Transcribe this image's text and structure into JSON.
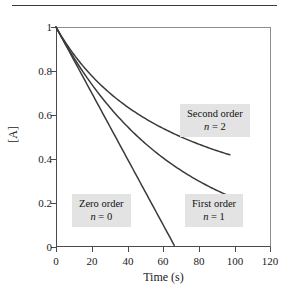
{
  "figure": {
    "top_rule": "horizontal-rule"
  },
  "axes": {
    "x_title": "Time (s)",
    "y_title": "[A]",
    "x_ticks": [
      "0",
      "20",
      "40",
      "60",
      "80",
      "100",
      "120"
    ],
    "y_ticks": [
      "0",
      "0.2",
      "0.4",
      "0.6",
      "0.8",
      "1"
    ]
  },
  "annotations": {
    "second": {
      "order": "Second order",
      "n_symbol": "n",
      "n_eq": " = 2"
    },
    "first": {
      "order": "First order",
      "n_symbol": "n",
      "n_eq": " = 1"
    },
    "zero": {
      "order": "Zero order",
      "n_symbol": "n",
      "n_eq": " = 0"
    }
  },
  "colors": {
    "curve": "#3a3a3a",
    "frame": "#4a4a4a",
    "frame_light": "#8d8d8d",
    "annot_background": "#e3e3e3",
    "text": "#1a1a1a",
    "background": "#ffffff"
  },
  "chart_data": {
    "type": "line",
    "title": "",
    "xlabel": "Time (s)",
    "ylabel": "[A]",
    "xlim": [
      0,
      120
    ],
    "ylim": [
      0,
      1
    ],
    "xticks": [
      0,
      20,
      40,
      60,
      80,
      100,
      120
    ],
    "yticks": [
      0,
      0.2,
      0.4,
      0.6,
      0.8,
      1
    ],
    "grid": false,
    "legend": "none (inline annotated labels)",
    "x": [
      0,
      10,
      20,
      30,
      40,
      50,
      60,
      70,
      80,
      90,
      97
    ],
    "series": [
      {
        "name": "Zero order (n = 0)",
        "n": 0,
        "annotation": "Zero order, n = 0",
        "model": "[A] = 1 - 0.0150 t",
        "x_intercept": 66.5,
        "x": [
          0,
          10,
          20,
          30,
          40,
          50,
          60,
          66.5
        ],
        "values": [
          1.0,
          0.85,
          0.7,
          0.55,
          0.4,
          0.25,
          0.1,
          0.0
        ]
      },
      {
        "name": "First order (n = 1)",
        "n": 1,
        "annotation": "First order, n = 1",
        "model": "[A] = exp(-0.01512 t)",
        "x": [
          0,
          10,
          20,
          30,
          40,
          50,
          60,
          70,
          80,
          90,
          97
        ],
        "values": [
          1.0,
          0.86,
          0.74,
          0.635,
          0.546,
          0.47,
          0.404,
          0.347,
          0.298,
          0.257,
          0.231
        ]
      },
      {
        "name": "Second order (n = 2)",
        "n": 2,
        "annotation": "Second order, n = 2",
        "model": "[A] = 1 / (1 + 0.0143 t)",
        "x": [
          0,
          10,
          20,
          30,
          40,
          50,
          60,
          70,
          80,
          90,
          97
        ],
        "values": [
          1.0,
          0.875,
          0.778,
          0.7,
          0.636,
          0.583,
          0.538,
          0.5,
          0.466,
          0.437,
          0.419
        ]
      }
    ]
  }
}
